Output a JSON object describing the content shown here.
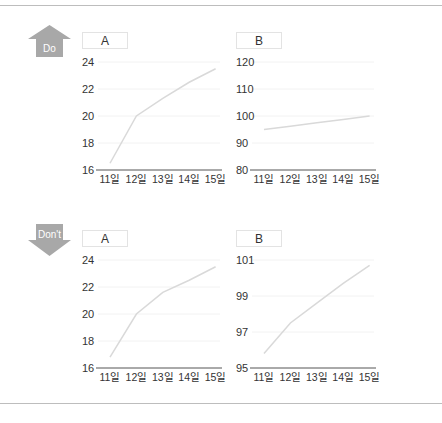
{
  "badges": {
    "do": "Do",
    "dont": "Don't"
  },
  "colors": {
    "line": "#d9d9d9",
    "axis": "#555555",
    "grid": "#f2f2f2",
    "badge": "#a8a8a8",
    "text": "#333333"
  },
  "chart_data": [
    {
      "group": "Do",
      "type": "line",
      "title": "A",
      "categories": [
        "11일",
        "12일",
        "13일",
        "14일",
        "15일"
      ],
      "values": [
        16.5,
        20,
        21.3,
        22.5,
        23.5
      ],
      "yticks": [
        16,
        18,
        20,
        22,
        24
      ],
      "ylim": [
        16,
        24
      ]
    },
    {
      "group": "Do",
      "type": "line",
      "title": "B",
      "categories": [
        "11일",
        "12일",
        "13일",
        "14일",
        "15일"
      ],
      "values": [
        95,
        96.2,
        97.5,
        98.7,
        100
      ],
      "yticks": [
        80,
        90,
        100,
        110,
        120
      ],
      "ylim": [
        80,
        120
      ]
    },
    {
      "group": "Don't",
      "type": "line",
      "title": "A",
      "categories": [
        "11일",
        "12일",
        "13일",
        "14일",
        "15일"
      ],
      "values": [
        16.8,
        20,
        21.6,
        22.5,
        23.5
      ],
      "yticks": [
        16,
        18,
        20,
        22,
        24
      ],
      "ylim": [
        16,
        24
      ]
    },
    {
      "group": "Don't",
      "type": "line",
      "title": "B",
      "categories": [
        "11일",
        "12일",
        "13일",
        "14일",
        "15일"
      ],
      "values": [
        95.8,
        97.5,
        98.6,
        99.7,
        100.7
      ],
      "yticks": [
        95,
        97,
        99,
        101
      ],
      "ylim": [
        95,
        101
      ]
    }
  ]
}
